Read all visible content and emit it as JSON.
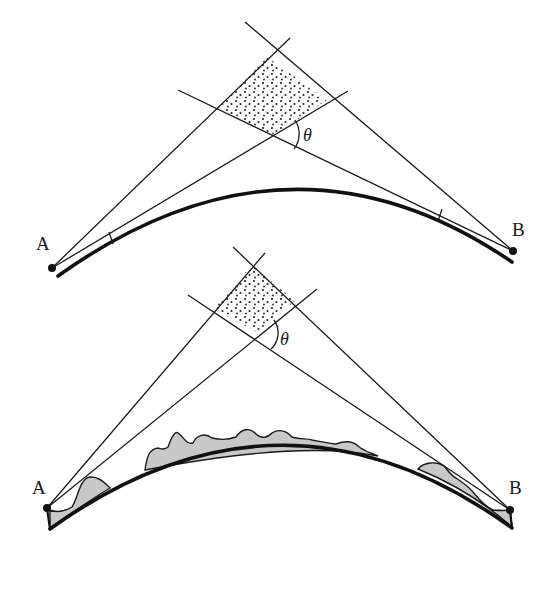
{
  "figure": {
    "colors": {
      "line": "#1a1a1a",
      "terrain_fill": "#c8c8c8",
      "stipple": "#222222",
      "background": "#ffffff"
    }
  },
  "top_diagram": {
    "point_a_label": "A",
    "point_b_label": "B",
    "angle_label": "θ",
    "points": {
      "A": [
        52,
        268
      ],
      "B": [
        513,
        251
      ]
    },
    "region": "stippled quadrilateral formed by two pairs of sight lines",
    "ticks": 2
  },
  "bottom_diagram": {
    "point_a_label": "A",
    "point_b_label": "B",
    "angle_label": "θ",
    "points": {
      "A": [
        47,
        508
      ],
      "B": [
        510,
        510
      ]
    },
    "region": "stippled quadrilateral formed by two pairs of sight lines",
    "terrain": "grey shaded irregular profile above the curved baseline"
  }
}
